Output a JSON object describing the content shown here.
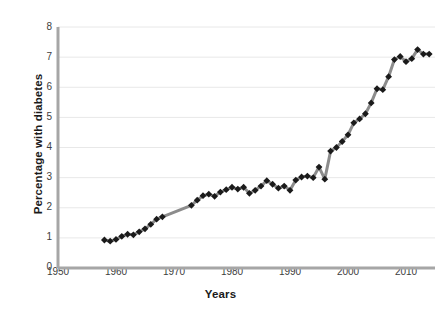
{
  "chart_data": {
    "type": "line",
    "title": "",
    "xlabel": "Years",
    "ylabel": "Percentage with diabetes",
    "xlim": [
      1950,
      2015
    ],
    "ylim": [
      0,
      8
    ],
    "xticks": [
      1950,
      1960,
      1970,
      1980,
      1990,
      2000,
      2010
    ],
    "yticks": [
      0,
      1,
      2,
      3,
      4,
      5,
      6,
      7,
      8
    ],
    "grid": "horizontal",
    "legend": "none",
    "marker": "diamond",
    "marker_color": "#1a1a1a",
    "line_color": "#8c8c8c",
    "axis_color": "#a6a6a6",
    "gridline_color": "#e8e8e8",
    "series": [
      {
        "name": "Percentage with diabetes",
        "x": [
          1958,
          1959,
          1960,
          1961,
          1962,
          1963,
          1964,
          1965,
          1966,
          1967,
          1968,
          1973,
          1974,
          1975,
          1976,
          1977,
          1978,
          1979,
          1980,
          1981,
          1982,
          1983,
          1984,
          1985,
          1986,
          1987,
          1988,
          1989,
          1990,
          1991,
          1992,
          1993,
          1994,
          1995,
          1996,
          1997,
          1998,
          1999,
          2000,
          2001,
          2002,
          2003,
          2004,
          2005,
          2006,
          2007,
          2008,
          2009,
          2010,
          2011,
          2012,
          2013,
          2014
        ],
        "values": [
          0.93,
          0.89,
          0.95,
          1.05,
          1.12,
          1.1,
          1.2,
          1.3,
          1.45,
          1.62,
          1.7,
          2.08,
          2.25,
          2.4,
          2.45,
          2.38,
          2.52,
          2.6,
          2.68,
          2.62,
          2.68,
          2.48,
          2.58,
          2.72,
          2.9,
          2.78,
          2.65,
          2.72,
          2.58,
          2.92,
          3.02,
          3.05,
          3.0,
          3.35,
          2.95,
          3.88,
          4.0,
          4.2,
          4.42,
          4.82,
          4.95,
          5.12,
          5.48,
          5.95,
          5.92,
          6.35,
          6.92,
          7.02,
          6.85,
          6.95,
          7.25,
          7.1,
          7.1
        ]
      }
    ]
  },
  "axes": {
    "y_tick_labels": [
      "8",
      "7",
      "6",
      "5",
      "4",
      "3",
      "2",
      "1",
      "0"
    ],
    "x_tick_labels": [
      "1950",
      "1960",
      "1970",
      "1980",
      "1990",
      "2000",
      "2010"
    ]
  },
  "labels": {
    "y_axis_title": "Percentage with diabetes",
    "x_axis_title": "Years"
  }
}
